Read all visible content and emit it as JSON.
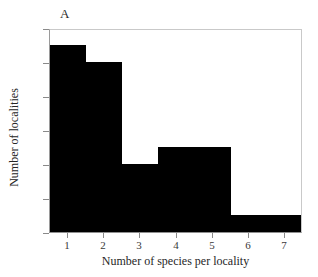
{
  "figure": {
    "panel_label": "A",
    "background_color": "#ffffff",
    "bar_color": "#000000",
    "frame_color": "#c9c9c9",
    "text_color": "#262626"
  },
  "chart_data": {
    "type": "bar",
    "title": "A",
    "xlabel": "Number of species per locality",
    "ylabel": "Number of localities",
    "categories": [
      "1",
      "2",
      "3",
      "4",
      "5",
      "6",
      "7"
    ],
    "values": [
      11,
      10,
      4,
      5,
      5,
      1,
      1
    ],
    "xlim": [
      0.5,
      7.5
    ],
    "ylim": [
      0,
      12
    ],
    "xticks": [
      "1",
      "2",
      "3",
      "4",
      "5",
      "6",
      "7"
    ],
    "yticks": [
      "0",
      "2",
      "4",
      "6",
      "8",
      "10",
      "12"
    ],
    "bin_width": 1,
    "grid": false,
    "legend": null,
    "series": [
      {
        "name": "Number of localities",
        "values": [
          11,
          10,
          4,
          5,
          5,
          1,
          1
        ],
        "color": "#000000"
      }
    ]
  }
}
